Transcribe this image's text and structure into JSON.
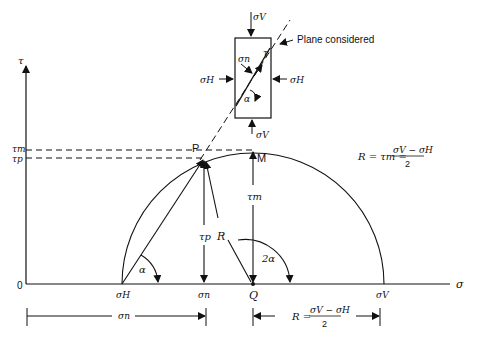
{
  "diagram": {
    "axes": {
      "x_label": "σ",
      "y_label": "τ",
      "origin": "0"
    },
    "left_ticks": {
      "tau_m": "τm",
      "tau_p": "τp"
    },
    "points": {
      "P": "P",
      "M": "M",
      "Q": "Q"
    },
    "x_ticks": {
      "sigma_H": "σH",
      "sigma_n": "σn",
      "Q": "Q",
      "sigma_V": "σV"
    },
    "segment_labels": {
      "R": "R",
      "tau_p": "τp",
      "tau_m": "τm",
      "alpha": "α",
      "two_alpha": "2α"
    },
    "formula_top": {
      "lhs": "R = τm =",
      "numerator": "σV − σH",
      "denominator": "2"
    },
    "formula_bottom": {
      "lhs": "R =",
      "numerator": "σV − σH",
      "denominator": "2"
    },
    "dimension_left": "σn",
    "element": {
      "top": "σV",
      "bottom": "σV",
      "left": "σH",
      "right": "σH",
      "normal": "σn",
      "shear": "τ",
      "angle": "α",
      "plane_label": "Plane considered"
    }
  }
}
